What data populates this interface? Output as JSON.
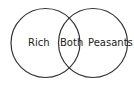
{
  "diagram": {
    "type": "venn",
    "sets": [
      {
        "label": "Rich"
      },
      {
        "label": "Peasants"
      }
    ],
    "intersection": {
      "label": "Both"
    },
    "stroke_color": "#333333"
  }
}
